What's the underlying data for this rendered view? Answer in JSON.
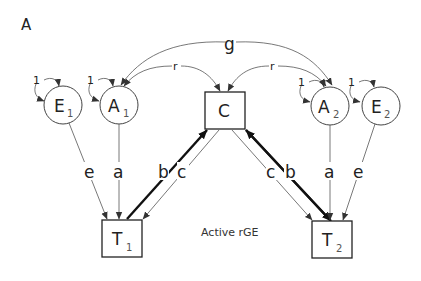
{
  "figure": {
    "panel_label": "A",
    "caption": "Active rGE"
  },
  "nodes": {
    "E1": {
      "main": "E",
      "sub": "1",
      "shape": "circle"
    },
    "A1": {
      "main": "A",
      "sub": "1",
      "shape": "circle"
    },
    "C": {
      "main": "C",
      "sub": "",
      "shape": "square"
    },
    "A2": {
      "main": "A",
      "sub": "2",
      "shape": "circle"
    },
    "E2": {
      "main": "E",
      "sub": "2",
      "shape": "circle"
    },
    "T1": {
      "main": "T",
      "sub": "1",
      "shape": "square"
    },
    "T2": {
      "main": "T",
      "sub": "2",
      "shape": "square"
    }
  },
  "variances": {
    "E1": "1",
    "A1": "1",
    "A2": "1",
    "E2": "1"
  },
  "correlations": {
    "g": "g",
    "r_left": "r",
    "r_right": "r"
  },
  "paths": {
    "e1_t1": "e",
    "a1_t1": "a",
    "t1_c": "b",
    "c_t1": "c",
    "c_t2": "c",
    "t2_c": "b",
    "a2_t2": "a",
    "e2_t2": "e"
  },
  "colors": {
    "line": "#555555",
    "bold_line": "#111111",
    "text": "#222222",
    "background": "#ffffff"
  }
}
